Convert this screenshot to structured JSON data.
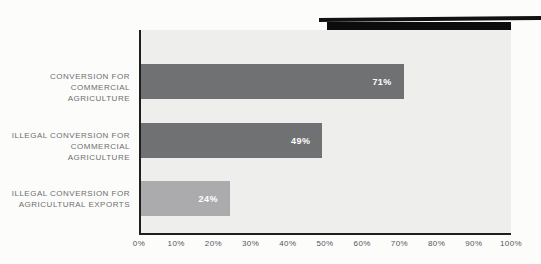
{
  "title_box": {
    "line1": "ESTIMATED SHARE OF",
    "line2_main": "TROPICAL DEFORESTATION,",
    "line2_date": " 2000-2012"
  },
  "chart_data": {
    "type": "bar",
    "orientation": "horizontal",
    "title": "ESTIMATED SHARE OF TROPICAL DEFORESTATION, 2000-2012",
    "xlabel": "",
    "ylabel": "",
    "xlim": [
      0,
      100
    ],
    "grid": false,
    "legend": "none",
    "categories": [
      "CONVERSION FOR COMMERCIAL AGRICULTURE",
      "ILLEGAL CONVERSION FOR COMMERCIAL AGRICULTURE",
      "ILLEGAL CONVERSION FOR AGRICULTURAL EXPORTS"
    ],
    "category_lines": [
      [
        "CONVERSION FOR",
        "COMMERCIAL AGRICULTURE"
      ],
      [
        "ILLEGAL CONVERSION FOR",
        "COMMERCIAL AGRICULTURE"
      ],
      [
        "ILLEGAL CONVERSION  FOR",
        "AGRICULTURAL EXPORTS"
      ]
    ],
    "values": [
      71,
      49,
      24
    ],
    "value_labels": [
      "71%",
      "49%",
      "24%"
    ],
    "bar_colors": [
      "#707173",
      "#707173",
      "#ababad"
    ],
    "x_tick_labels": [
      "0%",
      "10%",
      "20%",
      "30%",
      "40%",
      "50%",
      "60%",
      "70%",
      "80%",
      "90%",
      "100%"
    ],
    "x_tick_values": [
      0,
      10,
      20,
      30,
      40,
      50,
      60,
      70,
      80,
      90,
      100
    ],
    "colors": {
      "plot_background": "#eeeeec",
      "axis_line": "#1f1f1f",
      "title_background": "#0c0c0c",
      "title_text": "#ffffff",
      "value_label_text": "#ffffff",
      "category_label_text": "#6e6e6e"
    }
  }
}
